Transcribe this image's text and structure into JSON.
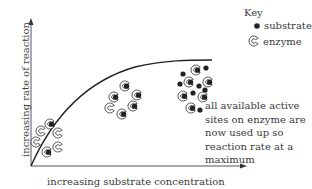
{
  "key": {
    "title": "Key",
    "items": [
      {
        "icon": "substrate-dot-icon",
        "label": "substrate"
      },
      {
        "icon": "enzyme-c-icon",
        "label": "enzyme"
      }
    ]
  },
  "axes": {
    "x_label": "increasing substrate concentration",
    "y_label": "increasing rate of reaction"
  },
  "annotation": "all available active sites on enzyme are now used up so reaction rate at a maximum",
  "colors": {
    "line": "#222222",
    "axis": "#555555",
    "enzyme_fill": "#ffffff",
    "enzyme_stroke": "#444444",
    "substrate": "#222222",
    "text": "#3a3a3a"
  }
}
